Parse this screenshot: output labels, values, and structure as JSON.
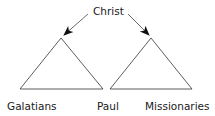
{
  "diagram": {
    "top_label": "Christ",
    "left_label": "Galatians",
    "middle_label": "Paul",
    "right_label": "Missionaries"
  },
  "colors": {
    "stroke": "#333333",
    "arrowhead": "#111111",
    "text": "#1a1a1a",
    "background": "#ffffff"
  }
}
